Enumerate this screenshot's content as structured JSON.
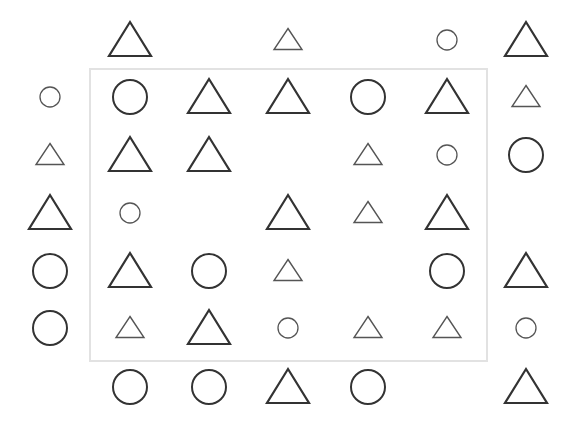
{
  "colors": {
    "background": "#ffffff",
    "frame": "#e2e2e2",
    "large_stroke": "#333333",
    "small_stroke": "#555555"
  },
  "frame": {
    "x": 89,
    "y": 68,
    "width": 399,
    "height": 294
  },
  "grid": {
    "columns_x": [
      50,
      130,
      209,
      288,
      368,
      447,
      526
    ],
    "rows_y": [
      40,
      97,
      155,
      213,
      271,
      328,
      387
    ]
  },
  "legend": {
    "LT": "large triangle",
    "ST": "small triangle",
    "LC": "large circle",
    "SC": "small circle",
    "_": "empty"
  },
  "cells": [
    [
      "_",
      "LT",
      "_",
      "ST",
      "_",
      "SC",
      "LT"
    ],
    [
      "SC",
      "LC",
      "LT",
      "LT",
      "LC",
      "LT",
      "ST"
    ],
    [
      "ST",
      "LT",
      "LT",
      "_",
      "ST",
      "SC",
      "LC"
    ],
    [
      "LT",
      "SC",
      "_",
      "LT",
      "ST",
      "LT",
      "_"
    ],
    [
      "LC",
      "LT",
      "LC",
      "ST",
      "_",
      "LC",
      "LT"
    ],
    [
      "LC",
      "ST",
      "LT",
      "SC",
      "ST",
      "ST",
      "SC"
    ],
    [
      "_",
      "LC",
      "LC",
      "LT",
      "LC",
      "_",
      "LT"
    ]
  ]
}
